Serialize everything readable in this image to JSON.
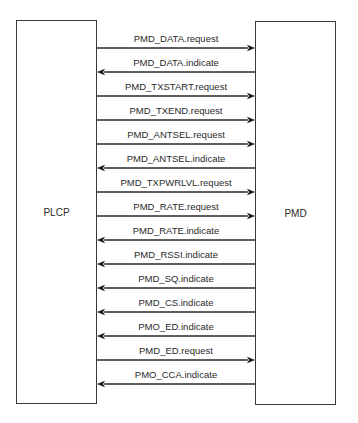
{
  "entities": {
    "left": {
      "label": "PLCP"
    },
    "right": {
      "label": "PMD"
    }
  },
  "primitives": [
    {
      "label": "PMD_DATA.request",
      "direction": "to-right"
    },
    {
      "label": "PMD_DATA.indicate",
      "direction": "to-left"
    },
    {
      "label": "PMD_TXSTART.request",
      "direction": "to-right"
    },
    {
      "label": "PMD_TXEND.request",
      "direction": "to-right"
    },
    {
      "label": "PMD_ANTSEL.request",
      "direction": "to-right"
    },
    {
      "label": "PMD_ANTSEL.indicate",
      "direction": "to-left"
    },
    {
      "label": "PMD_TXPWRLVL.request",
      "direction": "to-right"
    },
    {
      "label": "PMD_RATE.request",
      "direction": "to-right"
    },
    {
      "label": "PMD_RATE.indicate",
      "direction": "to-left"
    },
    {
      "label": "PMD_RSSI.indicate",
      "direction": "to-left"
    },
    {
      "label": "PMD_SQ.indicate",
      "direction": "to-left"
    },
    {
      "label": "PMD_CS.indicate",
      "direction": "to-left"
    },
    {
      "label": "PMO_ED.indicate",
      "direction": "to-left"
    },
    {
      "label": "PMD_ED.request",
      "direction": "to-right"
    },
    {
      "label": "PMO_CCA.indicate",
      "direction": "to-left"
    }
  ]
}
